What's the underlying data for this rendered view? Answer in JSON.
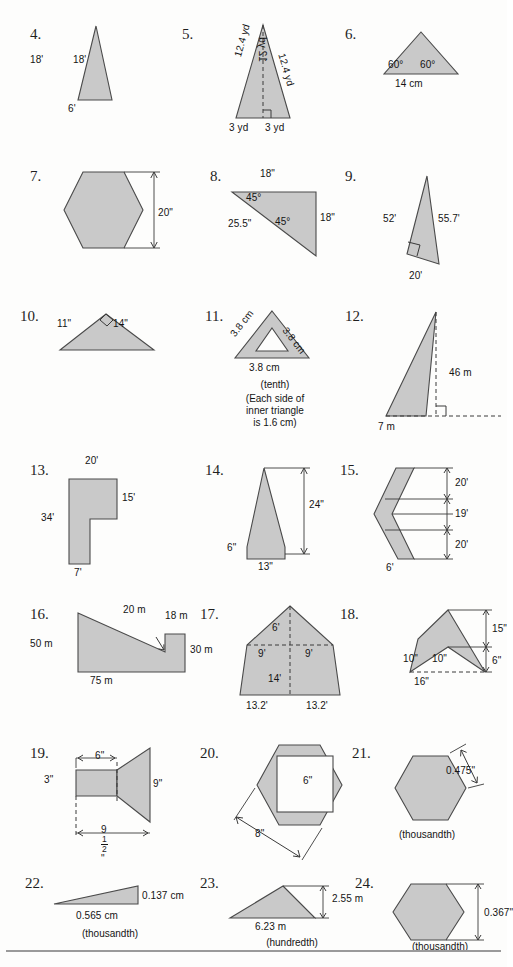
{
  "worksheet": {
    "title": "Area of polygons practice problems",
    "problems": [
      {
        "number": "4.",
        "shape": "isosceles-triangle",
        "labels": [
          "18'",
          "18'",
          "6'"
        ]
      },
      {
        "number": "5.",
        "shape": "isosceles-triangle-with-height",
        "labels": [
          "12.4 yd",
          "12.4 yd",
          "12 yd",
          "3 yd",
          "3 yd"
        ]
      },
      {
        "number": "6.",
        "shape": "equilateral-triangle",
        "labels": [
          "60°",
          "60°",
          "14 cm"
        ]
      },
      {
        "number": "7.",
        "shape": "hexagon",
        "labels": [
          "20\""
        ]
      },
      {
        "number": "8.",
        "shape": "right-triangle",
        "labels": [
          "18\"",
          "45°",
          "45°",
          "25.5\"",
          "18\""
        ]
      },
      {
        "number": "9.",
        "shape": "right-triangle-tall",
        "labels": [
          "52'",
          "55.7'",
          "20'"
        ]
      },
      {
        "number": "10.",
        "shape": "right-triangle-obtuse",
        "labels": [
          "11\"",
          "14\""
        ]
      },
      {
        "number": "11.",
        "shape": "triangle-with-triangular-hole",
        "labels": [
          "3.8 cm",
          "3.8 cm",
          "3.8 cm"
        ],
        "notes": [
          "(tenth)",
          "(Each side of",
          "inner triangle",
          "is 1.6 cm)"
        ]
      },
      {
        "number": "12.",
        "shape": "thin-right-triangle",
        "labels": [
          "46 m",
          "7 m"
        ]
      },
      {
        "number": "13.",
        "shape": "L-shape",
        "labels": [
          "20'",
          "15'",
          "34'",
          "7'"
        ]
      },
      {
        "number": "14.",
        "shape": "kite-triangle",
        "labels": [
          "24\"",
          "6\"",
          "13\""
        ]
      },
      {
        "number": "15.",
        "shape": "chevron-strip",
        "labels": [
          "20'",
          "19'",
          "20'",
          "6'"
        ]
      },
      {
        "number": "16.",
        "shape": "notched-polygon",
        "labels": [
          "20 m",
          "18 m",
          "50 m",
          "30 m",
          "75 m"
        ]
      },
      {
        "number": "17.",
        "shape": "pentagon-house",
        "labels": [
          "6'",
          "9'",
          "9'",
          "14'",
          "13.2'",
          "13.2'"
        ]
      },
      {
        "number": "18.",
        "shape": "arrowhead",
        "labels": [
          "15\"",
          "6\"",
          "10\"",
          "10\"",
          "16\""
        ]
      },
      {
        "number": "19.",
        "shape": "bar-with-flare",
        "labels": [
          "6\"",
          "3\"",
          "9\""
        ],
        "fraction_label": {
          "whole": "9",
          "numerator": "1",
          "denominator": "2",
          "unit": "\""
        }
      },
      {
        "number": "20.",
        "shape": "hexagon-with-square-hole",
        "labels": [
          "6\"",
          "8\""
        ]
      },
      {
        "number": "21.",
        "shape": "hexagon",
        "labels": [
          "0.475\""
        ],
        "notes": [
          "(thousandth)"
        ]
      },
      {
        "number": "22.",
        "shape": "thin-right-triangle-flat",
        "labels": [
          "0.137 cm",
          "0.565 cm"
        ],
        "notes": [
          "(thousandth)"
        ]
      },
      {
        "number": "23.",
        "shape": "obtuse-triangle",
        "labels": [
          "2.55 m",
          "6.23 m"
        ],
        "notes": [
          "(hundredth)"
        ]
      },
      {
        "number": "24.",
        "shape": "hexagon",
        "labels": [
          "0.367\""
        ],
        "notes": [
          "(thousandth)"
        ]
      }
    ]
  }
}
